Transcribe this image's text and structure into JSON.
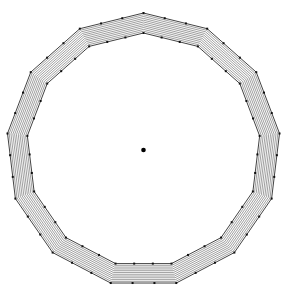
{
  "figure": {
    "background_color": "#ffffff",
    "line_color": "#2b2b2b",
    "edge_color": "#111111",
    "marker_color": "#101010",
    "center_marker_color": "#000000"
  },
  "chart_data": {
    "type": "scatter",
    "title": "",
    "subtitle": "",
    "xlabel": "",
    "ylabel": "",
    "grid": false,
    "legend": null,
    "axis_visible": false,
    "tick_labels": [],
    "annotations": [],
    "geometry": {
      "shape": "regular-polygon-ring",
      "sides": 13,
      "center": {
        "x": 143.5,
        "y": 150.0
      },
      "rotation_deg": -90,
      "outer_radius": 137.0,
      "inner_radius": 117.0,
      "ring_count": 12,
      "ring_radii": [
        117.0,
        118.8,
        120.6,
        122.5,
        124.3,
        126.1,
        128.0,
        129.8,
        131.6,
        133.5,
        135.3,
        137.0
      ],
      "xlim": [
        0,
        288
      ],
      "ylim": [
        0,
        300
      ]
    },
    "markers": {
      "vertex_marker_shape": "square",
      "vertex_marker_size": 2.0,
      "vertex_rings": [
        117.0,
        137.0
      ],
      "edge_subdivisions": 3,
      "center_marker_shape": "circle",
      "center_marker_size": 4.6
    },
    "series": [
      {
        "name": "outer boundary vertices",
        "radius": 137.0,
        "count": 13
      },
      {
        "name": "inner boundary vertices",
        "radius": 117.0,
        "count": 13
      },
      {
        "name": "center point",
        "x": 143.5,
        "y": 150.0
      }
    ]
  }
}
